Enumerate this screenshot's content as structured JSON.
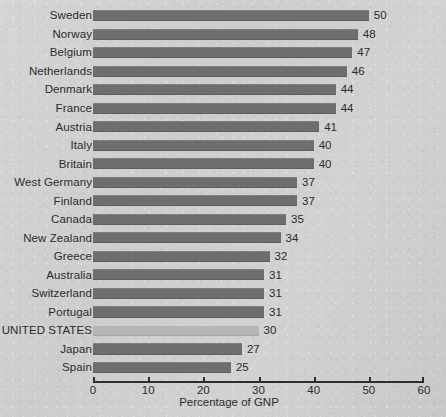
{
  "chart_data": {
    "type": "bar",
    "orientation": "horizontal",
    "title": "",
    "subtitle": "",
    "xlabel": "Percentage of GNP",
    "ylabel": "",
    "xlim": [
      0,
      60
    ],
    "xticks": [
      0,
      10,
      20,
      30,
      40,
      50,
      60
    ],
    "xtick_labels": [
      "0",
      "10",
      "20",
      "30",
      "40",
      "50",
      "60"
    ],
    "grid": false,
    "legend": false,
    "value_labels_shown": true,
    "categories": [
      "Sweden",
      "Norway",
      "Belgium",
      "Netherlands",
      "Denmark",
      "France",
      "Austria",
      "Italy",
      "Britain",
      "West Germany",
      "Finland",
      "Canada",
      "New Zealand",
      "Greece",
      "Australia",
      "Switzerland",
      "Portugal",
      "UNITED STATES",
      "Japan",
      "Spain"
    ],
    "values": [
      50,
      48,
      47,
      46,
      44,
      44,
      41,
      40,
      40,
      37,
      37,
      35,
      34,
      32,
      31,
      31,
      31,
      30,
      27,
      25
    ],
    "value_label_texts": [
      "50",
      "48",
      "47",
      "46",
      "44",
      "44",
      "41",
      "40",
      "40",
      "37",
      "37",
      "35",
      "34",
      "32",
      "31",
      "31",
      "31",
      "30",
      "27",
      "25"
    ],
    "highlighted_category": "UNITED STATES",
    "colors": {
      "bar": "#6e6e6e",
      "bar_highlight": "#b5b5b5",
      "background": "#cdcdcd",
      "axis": "#2e2e2e",
      "text": "#2b2b2b"
    }
  }
}
